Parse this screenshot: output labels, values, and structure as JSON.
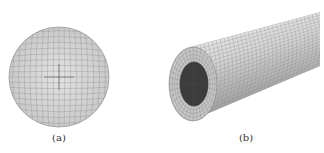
{
  "figure": {
    "panels": [
      {
        "id": "a",
        "label": "(a)",
        "description": "circular cross-section mesh",
        "shape": "disk",
        "center": [
          59,
          77
        ],
        "radius": 50
      },
      {
        "id": "b",
        "label": "(b)",
        "description": "3D cylindrical tube mesh with dark inner core",
        "shape": "tube"
      }
    ],
    "colors": {
      "mesh_fill": "#d4d4d4",
      "mesh_line": "#8a8a8a",
      "core_fill": "#3c3c3c",
      "tube_light": "#eeeeee",
      "tube_dark": "#9a9a9a",
      "caption": "#333333",
      "background": "#ffffff"
    }
  }
}
